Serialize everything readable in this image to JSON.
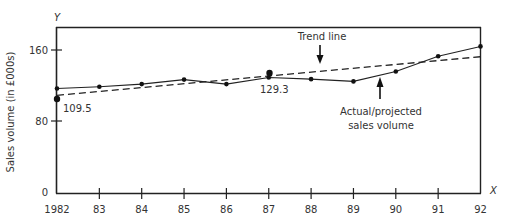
{
  "chart_data": {
    "type": "line",
    "title": "",
    "xlabel": "X",
    "ylabel": "Sales volume (in £000s)",
    "y_axis_letter": "Y",
    "x_axis_letter": "X",
    "categories": [
      "1982",
      "83",
      "84",
      "85",
      "86",
      "87",
      "88",
      "89",
      "90",
      "91",
      "92"
    ],
    "x": [
      1982,
      1983,
      1984,
      1985,
      1986,
      1987,
      1988,
      1989,
      1990,
      1991,
      1992
    ],
    "ylim": [
      0,
      190
    ],
    "yticks": [
      0,
      80,
      160
    ],
    "grid": false,
    "series": [
      {
        "name": "Actual/projected sales volume",
        "style": "solid-with-markers",
        "values": [
          117,
          119,
          122,
          127,
          122,
          129.3,
          127.5,
          125,
          136,
          153,
          164
        ]
      },
      {
        "name": "Trend line",
        "style": "dashed",
        "values": [
          109.5,
          113.8,
          118.1,
          122.4,
          126.7,
          131.0,
          135.3,
          139.6,
          143.9,
          148.2,
          152.5
        ]
      }
    ],
    "annotations": [
      {
        "text": "109.5",
        "x": 1982,
        "y": 109.5
      },
      {
        "text": "129.3",
        "x": 1987,
        "y": 129.3
      },
      {
        "text": "Trend line",
        "arrow": "down",
        "target": "Trend line"
      },
      {
        "text": "Actual/projected sales volume",
        "lines": [
          "Actual/projected",
          "sales volume"
        ],
        "arrow": "up",
        "target": "Actual/projected sales volume"
      }
    ],
    "legend": "none (annotated with arrows)"
  },
  "labels": {
    "y_letter": "Y",
    "x_letter": "X",
    "ylabel": "Sales volume (in £000s)",
    "ytick_160": "160",
    "ytick_80": "80",
    "ytick_0": "0",
    "annot_start": "109.5",
    "annot_mid": "129.3",
    "trend_label": "Trend line",
    "actual_label_1": "Actual/projected",
    "actual_label_2": "sales volume"
  },
  "colors": {
    "line": "#222222",
    "text": "#333333",
    "background": "#ffffff"
  }
}
